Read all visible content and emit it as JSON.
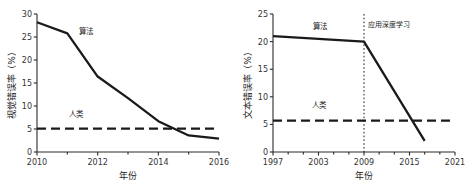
{
  "figure": {
    "background": "#ffffff",
    "ink_color": "#1a1a1a",
    "panel_count": 2
  },
  "chart_data": [
    {
      "id": "vision-error-rate",
      "type": "line",
      "title": "",
      "xlabel": "年份",
      "ylabel": "视觉错误率（%）",
      "xlim": [
        2010,
        2016
      ],
      "ylim": [
        0,
        30
      ],
      "grid": false,
      "legend_position": "inline-annotation",
      "xticks": [
        "2010",
        "2012",
        "2014",
        "2016"
      ],
      "xtick_values": [
        2010,
        2012,
        2014,
        2016
      ],
      "xminor_values": [
        2011,
        2013,
        2015
      ],
      "yticks": [
        "0",
        "5",
        "10",
        "15",
        "20",
        "25",
        "30"
      ],
      "ytick_values": [
        0,
        5,
        10,
        15,
        20,
        25,
        30
      ],
      "x": [
        2010,
        2011,
        2012,
        2013,
        2014,
        2015,
        2016
      ],
      "series": [
        {
          "name": "算法",
          "style": "solid",
          "label_x": 2011.6,
          "label_y": 25.6,
          "values": [
            28.2,
            25.8,
            16.4,
            11.7,
            6.7,
            3.6,
            2.9
          ]
        },
        {
          "name": "人类",
          "style": "dashed",
          "constant": 5.1,
          "label_x": 2011.3,
          "label_y": 7.6,
          "values": [
            5.1,
            5.1,
            5.1,
            5.1,
            5.1,
            5.1,
            5.1
          ]
        }
      ],
      "annotations": []
    },
    {
      "id": "text-error-rate",
      "type": "line",
      "title": "",
      "xlabel": "年份",
      "ylabel": "文本错误率（%）",
      "xlim": [
        1997,
        2021
      ],
      "ylim": [
        0,
        25
      ],
      "grid": false,
      "legend_position": "inline-annotation",
      "xticks": [
        "1997",
        "2003",
        "2009",
        "2015",
        "2021"
      ],
      "xtick_values": [
        1997,
        2003,
        2009,
        2015,
        2021
      ],
      "xminor_values": [
        1999,
        2001,
        2005,
        2007,
        2011,
        2013,
        2017,
        2019
      ],
      "yticks": [
        "0",
        "5",
        "10",
        "15",
        "20",
        "25"
      ],
      "ytick_values": [
        0,
        5,
        10,
        15,
        20,
        25
      ],
      "x": [
        1997,
        2009,
        2017
      ],
      "series": [
        {
          "name": "算法",
          "style": "solid",
          "label_x": 2003.2,
          "label_y": 22.3,
          "values": [
            21.0,
            20.0,
            2.0
          ]
        },
        {
          "name": "人类",
          "style": "dashed",
          "constant": 5.7,
          "label_x": 2003.0,
          "label_y": 7.9,
          "values": [
            5.7,
            5.7,
            5.7
          ]
        }
      ],
      "annotations": [
        {
          "name": "应用深度学习",
          "x": 2009,
          "label_x": 2009.5,
          "label_y": 22.6,
          "style": "vertical-dotted"
        }
      ]
    }
  ]
}
